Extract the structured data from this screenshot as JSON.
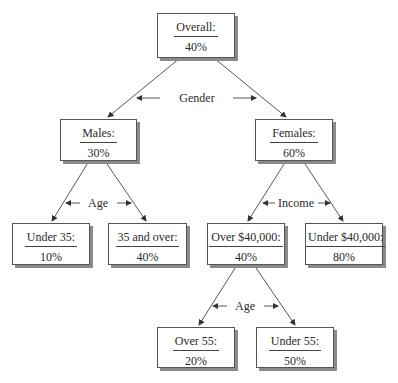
{
  "nodes": {
    "overall": {
      "title": "Overall:",
      "value": "40%"
    },
    "males": {
      "title": "Males:",
      "value": "30%"
    },
    "females": {
      "title": "Females:",
      "value": "60%"
    },
    "under35": {
      "title": "Under 35:",
      "value": "10%"
    },
    "over35": {
      "title": "35 and over:",
      "value": "40%"
    },
    "over40k": {
      "title": "Over $40,000:",
      "value": "40%"
    },
    "under40k": {
      "title": "Under $40,000:",
      "value": "80%"
    },
    "over55": {
      "title": "Over 55:",
      "value": "20%"
    },
    "under55": {
      "title": "Under 55:",
      "value": "50%"
    }
  },
  "splits": {
    "gender": "Gender",
    "age_males": "Age",
    "income": "Income",
    "age_over40k": "Age"
  }
}
